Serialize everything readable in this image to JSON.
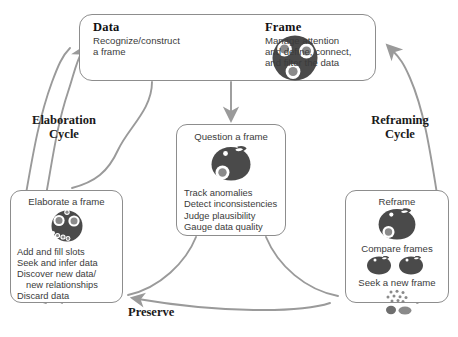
{
  "diagram": {
    "palette": {
      "blob_dark": "#4a4a4a",
      "blob_mid": "#8a8a8a",
      "arrow_gray": "#9a9a9a",
      "box_border": "#8d8d8d",
      "text_body": "#3b3b3b",
      "text_heading": "#111111",
      "background": "#ffffff"
    },
    "top_box": {
      "left": {
        "heading": "Data",
        "body": "Recognize/construct\na frame"
      },
      "icon": "frame-whole-icon",
      "right": {
        "heading": "Frame",
        "body": "Manage attention\nand define, connect,\nand filter the data"
      }
    },
    "center_box": {
      "title": "Question a frame",
      "icon": "frame-questioned-icon",
      "items": [
        "Track anomalies",
        "Detect inconsistencies",
        "Judge plausibility",
        "Gauge data quality"
      ]
    },
    "left_box": {
      "title": "Elaborate a frame",
      "icon": "frame-elaborated-icon",
      "items": [
        "Add and fill slots",
        "Seek and infer data",
        "Discover new data/",
        "new relationships",
        "Discard data"
      ]
    },
    "right_box": {
      "title": "Reframe",
      "icon_top": "frame-reframe-icon",
      "title2": "Compare frames",
      "icon_mid": "two-frames-compare-icon",
      "title3": "Seek a new frame",
      "icon_bottom": "scattered-data-icon"
    },
    "labels": {
      "elaboration_cycle": "Elaboration\nCycle",
      "reframing_cycle": "Reframing\nCycle",
      "preserve": "Preserve"
    },
    "caption": ""
  }
}
